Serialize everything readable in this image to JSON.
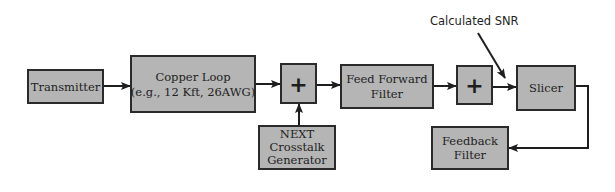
{
  "diagram": {
    "colors": {
      "box_fill": "#b5b5b5",
      "box_stroke": "#2a2a2a",
      "line": "#1e1e1e",
      "background": "#ffffff"
    },
    "blocks": {
      "transmitter": {
        "label": "Transmitter"
      },
      "copper_loop": {
        "line1": "Copper Loop",
        "line2": "(e.g., 12 Kft, 26AWG)"
      },
      "adder1": {
        "label": "+"
      },
      "next_generator": {
        "line1": "NEXT",
        "line2": "Crosstalk",
        "line3": "Generator"
      },
      "feed_forward": {
        "line1": "Feed Forward",
        "line2": "Filter"
      },
      "adder2": {
        "label": "+"
      },
      "slicer": {
        "label": "Slicer"
      },
      "feedback": {
        "line1": "Feedback",
        "line2": "Filter"
      }
    },
    "annotations": {
      "snr": "Calculated SNR"
    },
    "edges": [
      {
        "from": "Transmitter",
        "to": "Copper Loop"
      },
      {
        "from": "Copper Loop",
        "to": "Adder 1"
      },
      {
        "from": "NEXT Crosstalk Generator",
        "to": "Adder 1"
      },
      {
        "from": "Adder 1",
        "to": "Feed Forward Filter"
      },
      {
        "from": "Feed Forward Filter",
        "to": "Adder 2"
      },
      {
        "from": "Adder 2",
        "to": "Slicer"
      },
      {
        "from": "Slicer",
        "to": "Feedback Filter"
      },
      {
        "from": "Calculated SNR",
        "to": "Adder 2 → Slicer link"
      }
    ]
  }
}
